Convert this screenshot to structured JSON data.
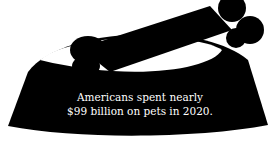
{
  "illustration": {
    "subject": "dog-bowl-with-bone",
    "fill": "#000000",
    "background": "#ffffff"
  },
  "caption": {
    "line1": "Americans spent nearly",
    "line2": "$99 billion on pets in 2020.",
    "color": "#ffffff"
  }
}
